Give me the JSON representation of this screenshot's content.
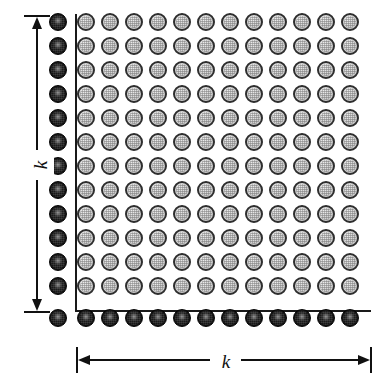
{
  "figure": {
    "type": "lattice-grid-diagram",
    "background_color": "#ffffff"
  },
  "grid": {
    "rows": 12,
    "columns": 12,
    "interior_node_count": 144,
    "interior_node_style": "light",
    "boundary_left_node_count": 12,
    "boundary_bottom_node_count": 13,
    "boundary_node_style": "dark",
    "cell_spacing_px": 24,
    "node_diameter_px": 18,
    "origin_x_px": 86,
    "origin_y_px": 22,
    "boundary_column_x_px": 58,
    "boundary_row_y_px": 318
  },
  "boundary_rules": {
    "vertical_rule": {
      "x": 75,
      "y": 14,
      "height": 298
    },
    "horizontal_rule": {
      "x": 75,
      "y": 310,
      "width": 296
    }
  },
  "colors": {
    "ink": "#111111",
    "rule": "#1a1a1a",
    "light_node_fill": "#d6d6d6",
    "light_node_ring": "#2e2e2e",
    "dark_node_fill": "#0b0b0b",
    "dark_node_highlight": "#8a8a8a",
    "paper": "#ffffff"
  },
  "dimensions": {
    "vertical": {
      "label": "k",
      "orientation": "vertical",
      "arrow_style": "double-headed",
      "end_caps": "serif",
      "x": 37,
      "top_y": 15,
      "bottom_y": 311,
      "label_y": 163
    },
    "horizontal": {
      "label": "k",
      "orientation": "horizontal",
      "arrow_style": "double-headed",
      "end_caps": "serif",
      "y": 360,
      "left_x": 76,
      "right_x": 370,
      "label_x": 223
    }
  }
}
